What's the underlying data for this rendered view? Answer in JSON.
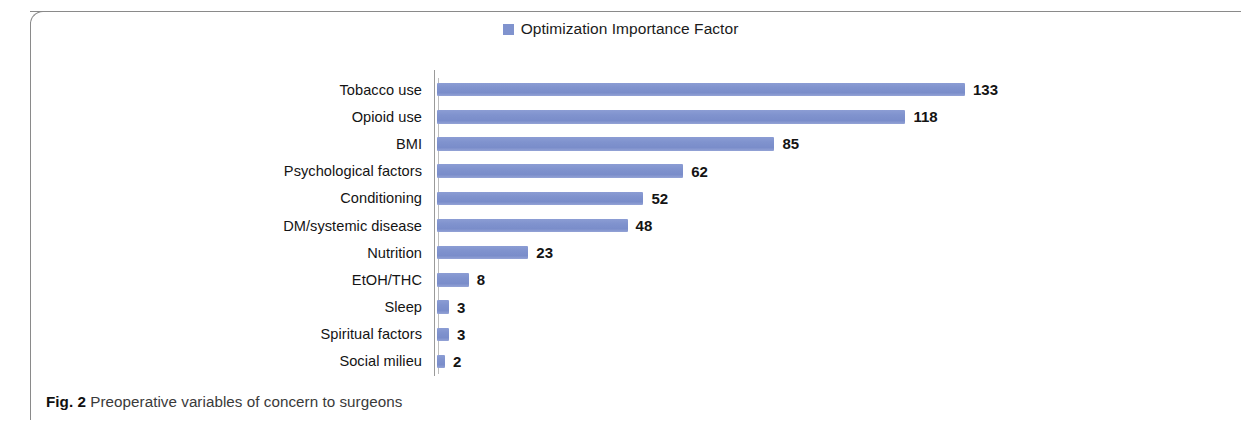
{
  "figure": {
    "caption_tag": "Fig. 2",
    "caption_text": "Preoperative variables of concern to surgeons"
  },
  "legend": {
    "label": "Optimization Importance Factor",
    "swatch_icon": "legend-square-icon",
    "color": "#8093CE"
  },
  "chart_data": {
    "type": "bar",
    "orientation": "horizontal",
    "title": "",
    "subtitle": "",
    "xlabel": "",
    "ylabel": "",
    "grid": false,
    "legend_position": "top-center",
    "series": [
      {
        "name": "Optimization Importance Factor",
        "color": "#8093CE",
        "values": [
          133,
          118,
          85,
          62,
          52,
          48,
          23,
          8,
          3,
          3,
          2
        ]
      }
    ],
    "categories": [
      "Tobacco use",
      "Opioid use",
      "BMI",
      "Psychological factors",
      "Conditioning",
      "DM/systemic disease",
      "Nutrition",
      "EtOH/THC",
      "Sleep",
      "Spiritual factors",
      "Social milieu"
    ],
    "data_labels": [
      "133",
      "118",
      "85",
      "62",
      "52",
      "48",
      "23",
      "8",
      "3",
      "3",
      "2"
    ],
    "xlim": [
      0,
      133
    ],
    "axis_ticks_visible": false
  }
}
